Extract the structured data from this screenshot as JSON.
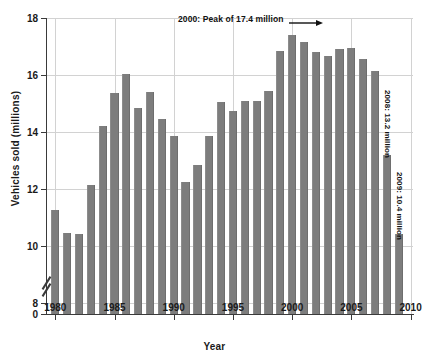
{
  "chart_data": {
    "type": "bar",
    "title": "",
    "xlabel": "Year",
    "ylabel": "Vehicles sold (millions)",
    "xlim": [
      1979.3,
      2010.2
    ],
    "ylim": [
      7.6,
      18
    ],
    "y_axis_break": true,
    "y_break_from": 0,
    "y_break_to": 7.6,
    "grid": true,
    "legend": "none",
    "bar_color": "#7d7d7d",
    "categories": [
      1980,
      1981,
      1982,
      1983,
      1984,
      1985,
      1986,
      1987,
      1988,
      1989,
      1990,
      1991,
      1992,
      1993,
      1994,
      1995,
      1996,
      1997,
      1998,
      1999,
      2000,
      2001,
      2002,
      2003,
      2004,
      2005,
      2006,
      2007,
      2008,
      2009
    ],
    "values": [
      11.25,
      10.45,
      10.4,
      12.15,
      14.2,
      15.35,
      16.05,
      14.85,
      15.4,
      14.45,
      13.85,
      12.25,
      12.85,
      13.85,
      15.05,
      14.75,
      15.1,
      15.1,
      15.45,
      16.85,
      17.4,
      17.15,
      16.8,
      16.65,
      16.9,
      16.95,
      16.55,
      16.15,
      13.2,
      10.4
    ],
    "yticks": [
      0,
      8,
      10,
      12,
      14,
      16,
      18
    ],
    "ytick_labels": [
      "0",
      "8",
      "10",
      "12",
      "14",
      "16",
      "18"
    ],
    "xticks": [
      1980,
      1985,
      1990,
      1995,
      2000,
      2005,
      2010
    ],
    "xtick_labels": [
      "1980",
      "1985",
      "1990",
      "1995",
      "2000",
      "2005",
      "2010"
    ],
    "annotations": [
      {
        "id": "peak",
        "text": "2000: Peak of 17.4 million",
        "year": 2000,
        "value": 17.4,
        "arrow": true
      },
      {
        "id": "y2008",
        "text": "2008: 13.2 million",
        "year": 2008,
        "value": 13.2,
        "rotated": true
      },
      {
        "id": "y2009",
        "text": "2009: 10.4 million",
        "year": 2009,
        "value": 10.4,
        "rotated": true
      }
    ]
  }
}
